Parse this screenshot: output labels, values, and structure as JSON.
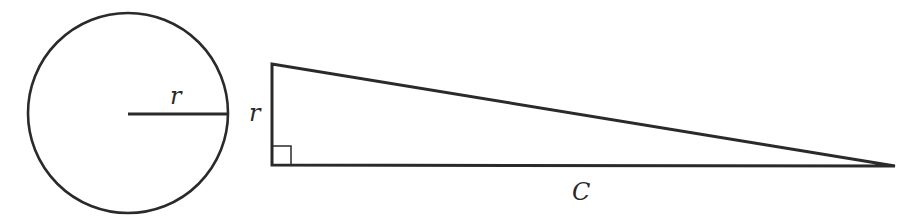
{
  "diagram": {
    "circle": {
      "center": [
        128,
        113
      ],
      "radius": 100,
      "radius_label": "r"
    },
    "triangle": {
      "vertices": [
        [
          272,
          64
        ],
        [
          272,
          165
        ],
        [
          895,
          166
        ]
      ],
      "height_label": "r",
      "base_label": "C",
      "right_angle_marker": true
    },
    "stroke_color": "#2a2a2a",
    "background": "#ffffff"
  }
}
